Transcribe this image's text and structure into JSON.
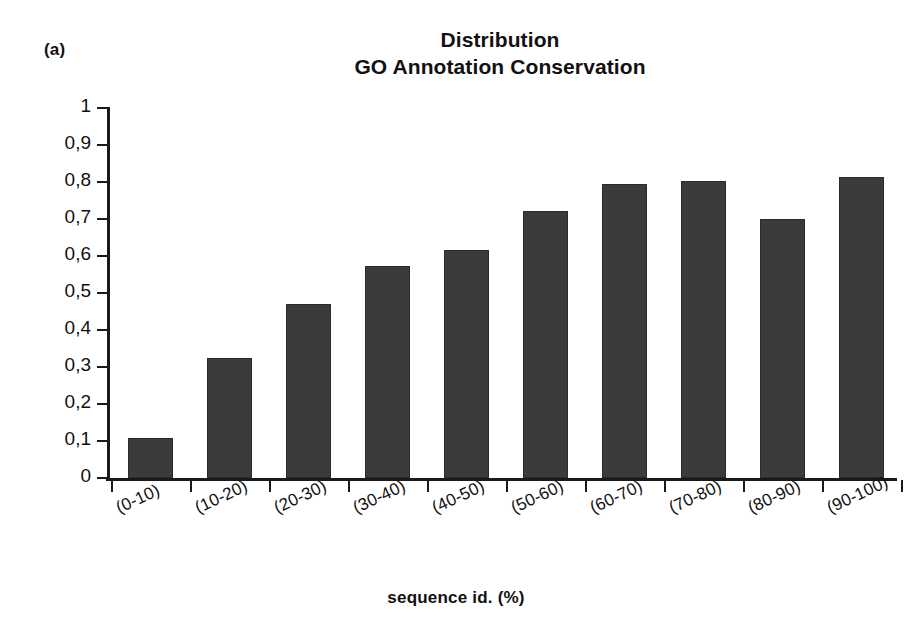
{
  "panel": {
    "label": "(a)"
  },
  "title": {
    "line1": "Distribution",
    "line2": "GO Annotation Conservation"
  },
  "axes": {
    "x_title": "sequence id. (%)",
    "y_ticklabels": [
      "1",
      "0,9",
      "0,8",
      "0,7",
      "0,6",
      "0,5",
      "0,4",
      "0,3",
      "0,2",
      "0,1",
      "0"
    ]
  },
  "style": {
    "bar_color": "#3b3b3b",
    "axis_color": "#1a1a1a",
    "background": "#ffffff"
  },
  "chart_data": {
    "type": "bar",
    "title": "Distribution GO Annotation Conservation",
    "xlabel": "sequence id. (%)",
    "ylabel": "",
    "categories": [
      "(0-10)",
      "(10-20)",
      "(20-30)",
      "(30-40)",
      "(40-50)",
      "(50-60)",
      "(60-70)",
      "(70-80)",
      "(80-90)",
      "(90-100)"
    ],
    "values": [
      0.107,
      0.324,
      0.471,
      0.572,
      0.616,
      0.723,
      0.794,
      0.802,
      0.7,
      0.813
    ],
    "ylim": [
      0,
      1
    ],
    "ytick_values": [
      0,
      0.1,
      0.2,
      0.3,
      0.4,
      0.5,
      0.6,
      0.7,
      0.8,
      0.9,
      1
    ],
    "ytick_labels": [
      "0",
      "0,1",
      "0,2",
      "0,3",
      "0,4",
      "0,5",
      "0,6",
      "0,7",
      "0,8",
      "0,9",
      "1"
    ],
    "grid": false,
    "legend": null,
    "bar_color": "#3b3b3b",
    "decimal_separator": ","
  }
}
